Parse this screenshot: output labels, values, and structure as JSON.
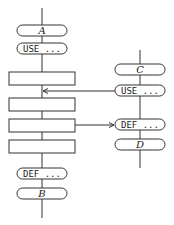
{
  "diagram": {
    "left_column": {
      "nodes": [
        {
          "type": "terminal",
          "label": "A"
        },
        {
          "type": "terminal",
          "label": "USE ..."
        },
        {
          "type": "process",
          "label": ""
        },
        {
          "type": "process",
          "label": ""
        },
        {
          "type": "process",
          "label": ""
        },
        {
          "type": "process",
          "label": ""
        },
        {
          "type": "terminal",
          "label": "DEF ..."
        },
        {
          "type": "terminal",
          "label": "B"
        }
      ]
    },
    "right_column": {
      "nodes": [
        {
          "type": "terminal",
          "label": "C"
        },
        {
          "type": "terminal",
          "label": "USE ..."
        },
        {
          "type": "terminal",
          "label": "DEF ..."
        },
        {
          "type": "terminal",
          "label": "D"
        }
      ]
    },
    "edges": [
      {
        "from": "right_column.USE",
        "to": "left_column.between_process_1_2",
        "arrow": "left"
      },
      {
        "from": "left_column.process_3",
        "to": "right_column.DEF",
        "arrow": "right"
      }
    ],
    "colors": {
      "line": "#333333",
      "background": "#ffffff"
    }
  }
}
